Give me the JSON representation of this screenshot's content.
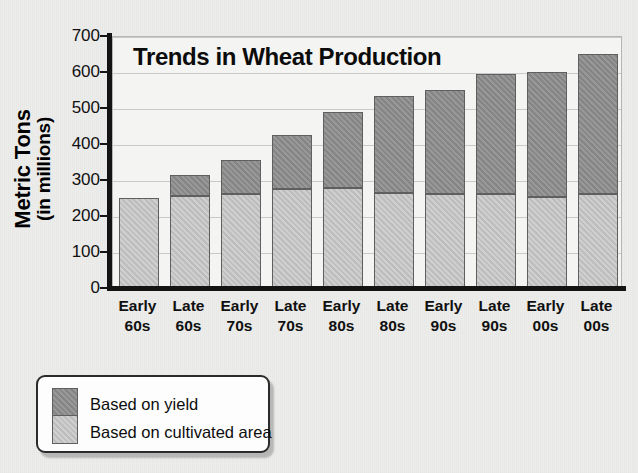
{
  "chart_data": {
    "type": "bar",
    "subtype": "stacked-bar",
    "title": "Trends in Wheat Production",
    "xlabel": "",
    "ylabel": "Metric Tons (in millions)",
    "ylabel_line1": "Metric Tons",
    "ylabel_line2": "(in millions)",
    "ylim": [
      0,
      700
    ],
    "ytick_step": 100,
    "yticks": [
      0,
      100,
      200,
      300,
      400,
      500,
      600,
      700
    ],
    "ytick_labels": [
      "0",
      "100",
      "200",
      "300",
      "400",
      "500",
      "600",
      "700"
    ],
    "grid": true,
    "legend_position": "below-axes-left",
    "categories": [
      "Early 60s",
      "Late 60s",
      "Early 70s",
      "Late 70s",
      "Early 80s",
      "Late 80s",
      "Early 90s",
      "Late 90s",
      "Early 00s",
      "Late 00s"
    ],
    "category_lines": [
      [
        "Early",
        "60s"
      ],
      [
        "Late",
        "60s"
      ],
      [
        "Early",
        "70s"
      ],
      [
        "Late",
        "70s"
      ],
      [
        "Early",
        "80s"
      ],
      [
        "Late",
        "80s"
      ],
      [
        "Early",
        "90s"
      ],
      [
        "Late",
        "90s"
      ],
      [
        "Early",
        "00s"
      ],
      [
        "Late",
        "00s"
      ]
    ],
    "series": [
      {
        "name": "Based on cultivated area",
        "color": "#c5c5c5",
        "values": [
          247,
          253,
          257,
          272,
          274,
          262,
          258,
          257,
          249,
          257
        ]
      },
      {
        "name": "Based on yield",
        "color": "#8c8c8c",
        "values": [
          0,
          57,
          96,
          150,
          213,
          269,
          290,
          335,
          347,
          391
        ]
      }
    ],
    "totals": [
      247,
      310,
      353,
      422,
      487,
      531,
      548,
      592,
      596,
      648
    ]
  },
  "chart": {
    "title": "Trends in Wheat Production",
    "y_axis": {
      "title_line1": "Metric Tons",
      "title_line2": "(in millions)",
      "ticks": [
        "700",
        "600",
        "500",
        "400",
        "300",
        "200",
        "100",
        "0"
      ]
    }
  },
  "legend": {
    "items": [
      {
        "label": "Based on yield",
        "color": "#8c8c8c"
      },
      {
        "label": "Based on cultivated area",
        "color": "#c5c5c5"
      }
    ]
  },
  "page": {
    "top_sliver_text": ""
  }
}
